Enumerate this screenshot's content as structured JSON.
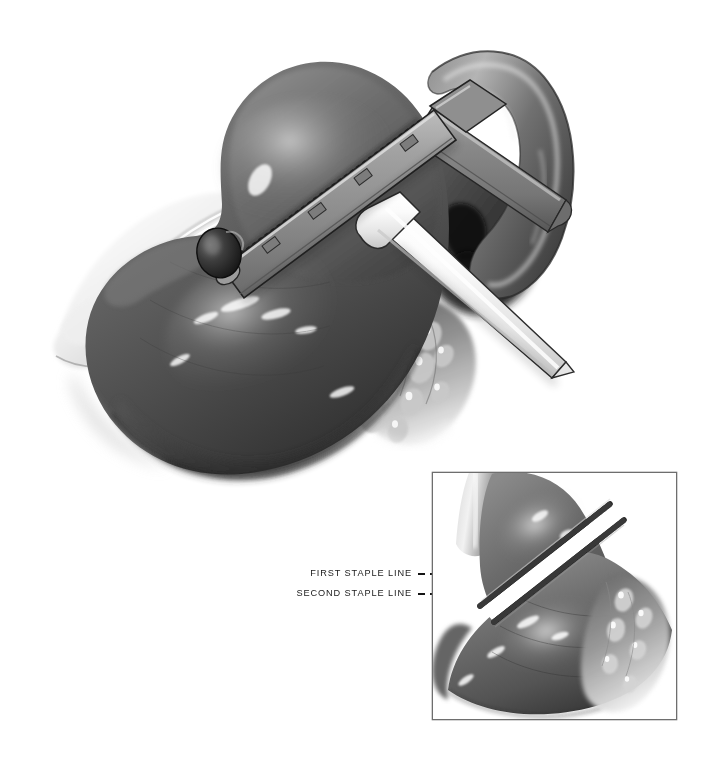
{
  "figure": {
    "background_color": "#ffffff",
    "ink_color": "#1b1b1b",
    "style": "grayscale medical airbrush illustration",
    "width": 717,
    "height": 769
  },
  "main_scene": {
    "name": "stomach-with-stapler",
    "anatomy": [
      {
        "id": "fundus",
        "label": "gastric fundus",
        "tone": "#6f6f6f"
      },
      {
        "id": "body",
        "label": "gastric body",
        "tone": "#5a5a5a"
      },
      {
        "id": "antrum",
        "label": "gastric antrum",
        "tone": "#4a4a4a"
      },
      {
        "id": "duodenum",
        "label": "duodenum",
        "tone": "#737373"
      },
      {
        "id": "lesser-omentum",
        "label": "lesser omentum",
        "tone": "#e2e2e2"
      },
      {
        "id": "greater-omentum",
        "label": "greater omentum",
        "tone": "#8a8a8a"
      },
      {
        "id": "pancreas",
        "label": "retrogastric tissue",
        "tone": "#3d3d3d"
      }
    ],
    "instrument": {
      "id": "linear-stapler",
      "label": "linear cutting stapler",
      "parts": [
        {
          "id": "lower-jaw",
          "label": "cartridge jaw",
          "tone": "#9a9a9a"
        },
        {
          "id": "upper-jaw",
          "label": "anvil jaw",
          "tone": "#808080"
        },
        {
          "id": "pivot-knob",
          "label": "pivot knob",
          "tone": "#3a3a3a"
        },
        {
          "id": "shaft",
          "label": "instrument shaft",
          "tone": "#f2f2f2"
        },
        {
          "id": "staple-track",
          "label": "staple track",
          "tone": "#2a2a2a"
        }
      ]
    }
  },
  "inset": {
    "name": "completed-transection-inset",
    "border_color": "#6e6e6e",
    "bounds": {
      "x": 432,
      "y": 472,
      "width": 245,
      "height": 248
    },
    "contents": [
      {
        "id": "esophagus",
        "label": "esophagus"
      },
      {
        "id": "proximal-pouch",
        "label": "proximal gastric pouch"
      },
      {
        "id": "distal-stomach",
        "label": "distal stomach"
      },
      {
        "id": "omentum",
        "label": "greater omentum"
      },
      {
        "id": "division-gap",
        "label": "division gap",
        "tone": "#ffffff"
      }
    ]
  },
  "annotations": {
    "items": [
      {
        "id": "first-staple-line",
        "text": "FIRST STAPLE LINE",
        "text_x": 412,
        "text_y": 574,
        "leader": {
          "x1": 418,
          "y1": 574,
          "x2": 508,
          "y2": 574
        }
      },
      {
        "id": "second-staple-line",
        "text": "SECOND STAPLE LINE",
        "text_x": 412,
        "text_y": 594,
        "leader": {
          "x1": 418,
          "y1": 594,
          "x2": 508,
          "y2": 594
        }
      }
    ]
  }
}
